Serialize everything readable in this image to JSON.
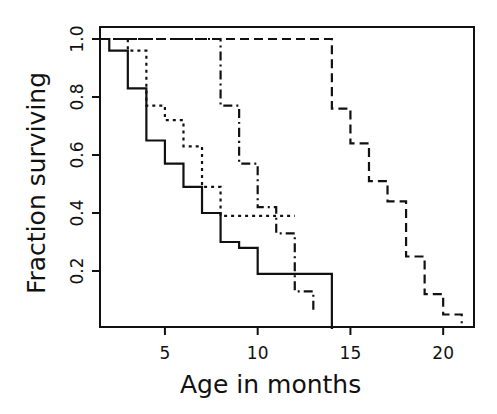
{
  "chart_data": {
    "type": "line",
    "subtype": "step (Kaplan-Meier survival curves)",
    "title": "",
    "xlabel": "Age in months",
    "ylabel": "Fraction surviving",
    "xlim": [
      1.5,
      21.7
    ],
    "ylim": [
      0,
      1.03
    ],
    "xticks": [
      5,
      10,
      15,
      20
    ],
    "yticks": [
      0.2,
      0.4,
      0.6,
      0.8,
      1.0
    ],
    "ytick_labels": [
      "0.2",
      "0.4",
      "0.6",
      "0.8",
      "1.0"
    ],
    "xtick_labels": [
      "5",
      "10",
      "15",
      "20"
    ],
    "grid": false,
    "legend": null,
    "series": [
      {
        "name": "solid",
        "line_style": "solid",
        "color": "#111111",
        "x": [
          1.5,
          2,
          3,
          4,
          5,
          6,
          7,
          8,
          9,
          10,
          14
        ],
        "y": [
          1.0,
          0.96,
          0.83,
          0.65,
          0.57,
          0.49,
          0.4,
          0.3,
          0.28,
          0.19,
          0.0
        ],
        "end_x": 14
      },
      {
        "name": "dotted",
        "line_style": "dotted",
        "color": "#111111",
        "x": [
          1.5,
          3,
          4,
          5,
          6,
          7,
          8
        ],
        "y": [
          1.0,
          0.96,
          0.77,
          0.72,
          0.63,
          0.49,
          0.39
        ],
        "end_x": 12
      },
      {
        "name": "dash-dot",
        "line_style": "dashdot",
        "color": "#111111",
        "x": [
          1.5,
          8,
          9,
          10,
          11,
          12,
          13
        ],
        "y": [
          1.0,
          0.77,
          0.57,
          0.42,
          0.33,
          0.13,
          0.06
        ],
        "end_x": 13
      },
      {
        "name": "dashed",
        "line_style": "dashed",
        "color": "#111111",
        "x": [
          1.5,
          14,
          15,
          16,
          17,
          18,
          19,
          20,
          21
        ],
        "y": [
          1.0,
          0.76,
          0.64,
          0.51,
          0.44,
          0.25,
          0.12,
          0.05,
          0.02
        ],
        "end_x": 21
      }
    ]
  }
}
